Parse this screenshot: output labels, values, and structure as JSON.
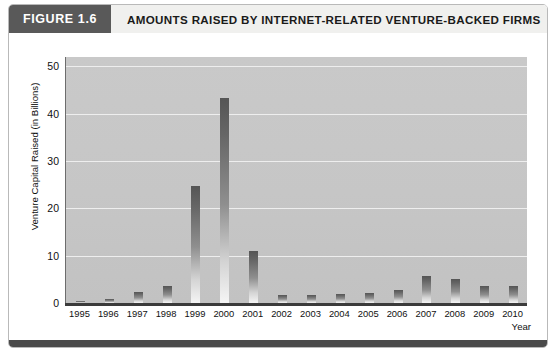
{
  "figure": {
    "tag": "FIGURE 1.6",
    "title": "AMOUNTS RAISED BY INTERNET-RELATED VENTURE-BACKED FIRMS",
    "tag_background": "#595959",
    "title_background": "#f0f0ee",
    "footer_color": "#4a4a4a"
  },
  "chart_data": {
    "type": "bar",
    "title": "AMOUNTS RAISED BY INTERNET-RELATED VENTURE-BACKED FIRMS",
    "xlabel": "Year",
    "ylabel": "Venture Capital Raised (in Billions)",
    "categories": [
      "1995",
      "1996",
      "1997",
      "1998",
      "1999",
      "2000",
      "2001",
      "2002",
      "2003",
      "2004",
      "2005",
      "2006",
      "2007",
      "2008",
      "2009",
      "2010"
    ],
    "values": [
      0.3,
      0.8,
      2.3,
      3.6,
      24.7,
      43.4,
      11.0,
      1.8,
      1.7,
      2.0,
      2.2,
      2.8,
      5.8,
      5.0,
      3.6,
      3.5
    ],
    "ylim": [
      0,
      52
    ],
    "yticks": [
      0,
      10,
      20,
      30,
      40,
      50
    ],
    "ytick_labels": [
      "0",
      "10",
      "20",
      "30",
      "40",
      "50"
    ],
    "grid": true,
    "grid_color": "#eeeeee",
    "legend": null,
    "plot_background": "#c6c6c6",
    "bar_color_top": "#555555",
    "bar_color_bottom": "#f5f5f5"
  }
}
